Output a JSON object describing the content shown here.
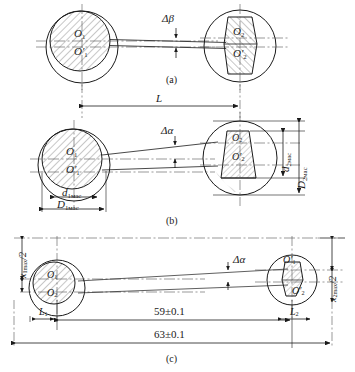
{
  "figure": {
    "background_color": "#ffffff",
    "line_color": "#1a1a1a",
    "hatch_color": "#555555",
    "centerline_color": "#555555"
  },
  "panels": [
    {
      "id": "a",
      "caption": "(a)",
      "angle_label": "Δβ",
      "left_hub": {
        "center_labels": [
          "O",
          "O"
        ],
        "primed": [
          false,
          true
        ]
      },
      "right_hub": {
        "center_labels": [
          "O",
          "O"
        ],
        "primed": [
          false,
          true
        ]
      }
    },
    {
      "id": "b",
      "caption": "(b)",
      "angle_label": "Δα",
      "span_label": "L",
      "left_hub": {
        "center_labels": [
          "O",
          "O"
        ],
        "primed": [
          false,
          true
        ]
      },
      "right_hub": {
        "center_labels": [
          "O",
          "O"
        ],
        "primed": [
          false,
          true
        ]
      },
      "dimensions": [
        {
          "name": "d1meas",
          "base": "d",
          "sub": "1мас",
          "orientation": "horizontal"
        },
        {
          "name": "D1meas",
          "base": "D",
          "sub": "1мас",
          "orientation": "horizontal"
        },
        {
          "name": "d2meas",
          "base": "d",
          "sub": "2мас",
          "orientation": "vertical"
        },
        {
          "name": "D2meas",
          "base": "D",
          "sub": "2мас",
          "orientation": "vertical"
        }
      ]
    },
    {
      "id": "c",
      "caption": "(c)",
      "angle_label": "Δα",
      "left_hub": {
        "center_labels": [
          "O",
          "O"
        ],
        "primed": [
          false,
          false
        ]
      },
      "right_hub": {
        "center_labels": [
          "O",
          "O"
        ],
        "primed": [
          true,
          true
        ]
      },
      "dimensions": [
        {
          "name": "L1",
          "base": "L",
          "sub": "1"
        },
        {
          "name": "L2",
          "base": "L",
          "sub": "2"
        },
        {
          "name": "inner-span",
          "value": "59±0.1"
        },
        {
          "name": "outer-span",
          "value": "63±0.1"
        },
        {
          "name": "x1max-half",
          "base": "x",
          "sub": "1max",
          "suffix": "/2",
          "orientation": "vertical"
        },
        {
          "name": "x2max-half",
          "base": "x",
          "sub": "2max",
          "suffix": "/2",
          "orientation": "vertical"
        }
      ]
    }
  ],
  "labels": {
    "delta_beta": "Δβ",
    "delta_alpha": "Δα",
    "L": "L",
    "O": "O",
    "O_prime": "O′",
    "d": "d",
    "D": "D",
    "x": "x",
    "sub_1mac": "1мас",
    "sub_2mac": "2мас",
    "sub_1": "1",
    "sub_2": "2",
    "sub_1max": "1max",
    "sub_2max": "2max",
    "half": "/2",
    "span_59": "59±0.1",
    "span_63": "63±0.1",
    "cap_a": "(a)",
    "cap_b": "(b)",
    "cap_c": "(c)"
  }
}
